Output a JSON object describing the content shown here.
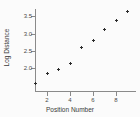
{
  "chart_data": {
    "type": "scatter",
    "title": "",
    "xlabel": "Position Number",
    "ylabel": "Log Distance",
    "x": [
      1,
      2,
      3,
      4,
      5,
      6,
      7,
      8,
      9
    ],
    "values": [
      1.55,
      1.85,
      1.97,
      2.13,
      2.58,
      2.81,
      3.12,
      3.38,
      3.64
    ],
    "xticks": [
      2,
      4,
      6,
      8
    ],
    "xtick_labels": [
      "2",
      "4",
      "6",
      "8"
    ],
    "yticks": [
      2.0,
      2.5,
      3.0,
      3.5
    ],
    "ytick_labels": [
      "2.0",
      "2.5",
      "3.0",
      "3.5"
    ],
    "xlim": [
      0.6,
      9.4
    ],
    "ylim": [
      1.4,
      3.8
    ],
    "grid": false,
    "legend": false,
    "marker": "plus",
    "marker_color": "#2b2b2b",
    "axis_color": "#8a8a8a",
    "background": "#fbfbfb"
  }
}
